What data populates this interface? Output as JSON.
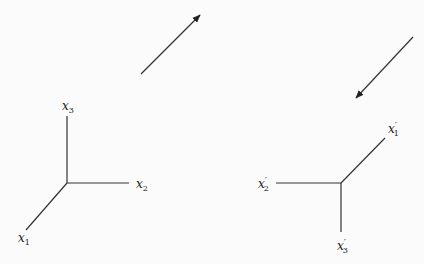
{
  "diagram": {
    "type": "coordinate-axes-rotation",
    "colors": {
      "line": "#333333",
      "background": "#fbfbfb"
    },
    "arrows": [
      {
        "name": "arrow-up-right",
        "from": [
          141,
          74
        ],
        "to": [
          200,
          15
        ]
      },
      {
        "name": "arrow-down-left",
        "from": [
          413,
          37
        ],
        "to": [
          356,
          98
        ]
      }
    ],
    "left_axes": {
      "origin": [
        67,
        183
      ],
      "axes": [
        {
          "name": "x1",
          "base": "x",
          "sub": "1",
          "prime": "",
          "end": [
            26,
            230
          ],
          "label_pos": [
            18,
            242
          ]
        },
        {
          "name": "x2",
          "base": "x",
          "sub": "2",
          "prime": "",
          "end": [
            129,
            183
          ],
          "label_pos": [
            136,
            188
          ]
        },
        {
          "name": "x3",
          "base": "x",
          "sub": "3",
          "prime": "",
          "end": [
            67,
            116
          ],
          "label_pos": [
            62,
            110
          ]
        }
      ]
    },
    "right_axes": {
      "origin": [
        341,
        183
      ],
      "axes": [
        {
          "name": "x1-prime",
          "base": "x",
          "sub": "1",
          "prime": "′",
          "end": [
            385,
            138
          ],
          "label_pos": [
            388,
            133
          ]
        },
        {
          "name": "x2-prime",
          "base": "x",
          "sub": "2",
          "prime": "′",
          "end": [
            276,
            183
          ],
          "label_pos": [
            258,
            188
          ]
        },
        {
          "name": "x3-prime",
          "base": "x",
          "sub": "3",
          "prime": "′",
          "end": [
            341,
            232
          ],
          "label_pos": [
            337,
            250
          ]
        }
      ]
    }
  }
}
